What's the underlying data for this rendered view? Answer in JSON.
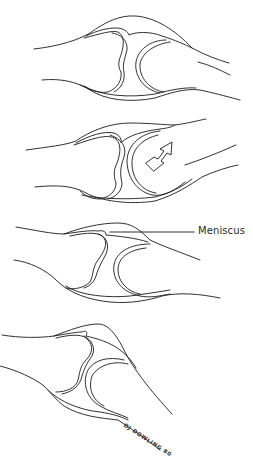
{
  "figure": {
    "panels": [
      {
        "id": "joint-normal",
        "description": "Joint in neutral position"
      },
      {
        "id": "joint-rotation",
        "description": "Joint with rotation arrow",
        "arrow": "curved-arrow"
      },
      {
        "id": "joint-meniscus",
        "description": "Joint with meniscus labeled"
      },
      {
        "id": "joint-flexed",
        "description": "Joint in flexed position"
      }
    ],
    "labels": {
      "meniscus": "Meniscus"
    },
    "signature": "DJ DOWLING 80"
  }
}
